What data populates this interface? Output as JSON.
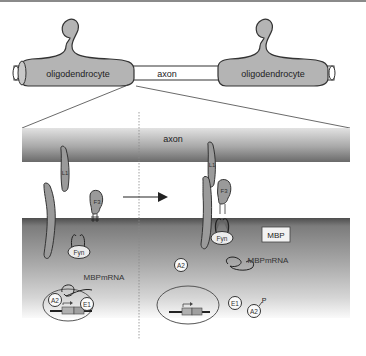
{
  "overview": {
    "left_cell_label": "oligodendrocyte",
    "axon_label": "axon",
    "right_cell_label": "oligodendrocyte"
  },
  "detail": {
    "axon_label": "axon",
    "left_panel": {
      "proteins": {
        "l1": "L1",
        "f3": "F3",
        "fyn": "Fyn"
      },
      "mrna_label": "MBPmRNA",
      "nucleus": {
        "a2": "A2",
        "e1": "E1"
      }
    },
    "right_panel": {
      "proteins": {
        "l1": "L1",
        "f3": "F3",
        "fyn": "Fyn"
      },
      "mbp_label": "MBP",
      "mrna_label": "MBPmRNA",
      "free_a2": "A2",
      "free_e1": "E1",
      "phospho_a2": "A2",
      "phospho_mark": "P"
    }
  },
  "colors": {
    "cell_fill": "#b4b4b4",
    "outline": "#333333",
    "axon_dark": "#7a7a7a",
    "axon_light": "#d8d8d8",
    "cytoplasm_dark": "#6e6e6e",
    "cytoplasm_light": "#f0f0f0",
    "protein_fill": "#9a9a9a"
  }
}
